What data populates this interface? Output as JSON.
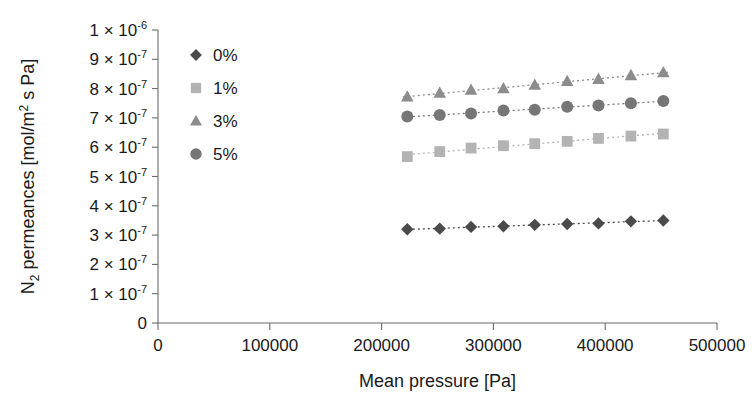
{
  "chart_data": {
    "type": "scatter",
    "title": "",
    "xlabel": "Mean pressure [Pa]",
    "ylabel": "N2 permeances [mol/m2 s Pa]",
    "ylabel_parts": {
      "lead": "N",
      "sub": "2",
      "mid": " permeances [mol/m",
      "sup": "2",
      "tail": " s Pa]"
    },
    "xlim": [
      0,
      500000
    ],
    "ylim": [
      0,
      1e-06
    ],
    "xticks": [
      0,
      100000,
      200000,
      300000,
      400000,
      500000
    ],
    "xtick_labels": [
      "0",
      "100000",
      "200000",
      "300000",
      "400000",
      "500000"
    ],
    "yticks": [
      0,
      1e-07,
      2e-07,
      3e-07,
      4e-07,
      5e-07,
      6e-07,
      7e-07,
      8e-07,
      9e-07,
      1e-06
    ],
    "ytick_labels": [
      {
        "mantissa": "0",
        "has_exp": false,
        "exp": ""
      },
      {
        "mantissa": "1 × 10",
        "has_exp": true,
        "exp": "-7"
      },
      {
        "mantissa": "2 × 10",
        "has_exp": true,
        "exp": "-7"
      },
      {
        "mantissa": "3 × 10",
        "has_exp": true,
        "exp": "-7"
      },
      {
        "mantissa": "4 × 10",
        "has_exp": true,
        "exp": "-7"
      },
      {
        "mantissa": "5 × 10",
        "has_exp": true,
        "exp": "-7"
      },
      {
        "mantissa": "6 × 10",
        "has_exp": true,
        "exp": "-7"
      },
      {
        "mantissa": "7 × 10",
        "has_exp": true,
        "exp": "-7"
      },
      {
        "mantissa": "8 × 10",
        "has_exp": true,
        "exp": "-7"
      },
      {
        "mantissa": "9 × 10",
        "has_exp": true,
        "exp": "-7"
      },
      {
        "mantissa": "1 × 10",
        "has_exp": true,
        "exp": "-6"
      }
    ],
    "grid": false,
    "legend_position": "upper-left-inside",
    "series": [
      {
        "name": "0%",
        "marker": "diamond",
        "color": "#4a4a4a",
        "trendline": true,
        "x": [
          223000,
          252000,
          280000,
          309000,
          337000,
          366000,
          394000,
          423000,
          452000
        ],
        "y": [
          3.2e-07,
          3.22e-07,
          3.28e-07,
          3.3e-07,
          3.35e-07,
          3.38e-07,
          3.4e-07,
          3.47e-07,
          3.5e-07
        ]
      },
      {
        "name": "1%",
        "marker": "square",
        "color": "#b3b3b3",
        "trendline": true,
        "x": [
          223000,
          252000,
          280000,
          309000,
          337000,
          366000,
          394000,
          423000,
          452000
        ],
        "y": [
          5.68e-07,
          5.85e-07,
          5.97e-07,
          6.05e-07,
          6.12e-07,
          6.2e-07,
          6.3e-07,
          6.38e-07,
          6.45e-07
        ]
      },
      {
        "name": "3%",
        "marker": "triangle",
        "color": "#8c8c8c",
        "trendline": true,
        "x": [
          223000,
          252000,
          280000,
          309000,
          337000,
          366000,
          394000,
          423000,
          452000
        ],
        "y": [
          7.72e-07,
          7.85e-07,
          7.95e-07,
          8e-07,
          8.12e-07,
          8.25e-07,
          8.32e-07,
          8.45e-07,
          8.55e-07
        ]
      },
      {
        "name": "5%",
        "marker": "circle",
        "color": "#767676",
        "trendline": true,
        "x": [
          223000,
          252000,
          280000,
          309000,
          337000,
          366000,
          394000,
          423000,
          452000
        ],
        "y": [
          7.05e-07,
          7.1e-07,
          7.15e-07,
          7.25e-07,
          7.28e-07,
          7.38e-07,
          7.42e-07,
          7.5e-07,
          7.58e-07
        ]
      }
    ]
  },
  "legend": {
    "items": [
      {
        "label": "0%",
        "marker": "diamond",
        "color": "#4a4a4a"
      },
      {
        "label": "1%",
        "marker": "square",
        "color": "#b3b3b3"
      },
      {
        "label": "3%",
        "marker": "triangle",
        "color": "#8c8c8c"
      },
      {
        "label": "5%",
        "marker": "circle",
        "color": "#767676"
      }
    ]
  },
  "colors": {
    "axis": "#6b6b6b",
    "text": "#1a1a1a",
    "background": "#ffffff"
  }
}
